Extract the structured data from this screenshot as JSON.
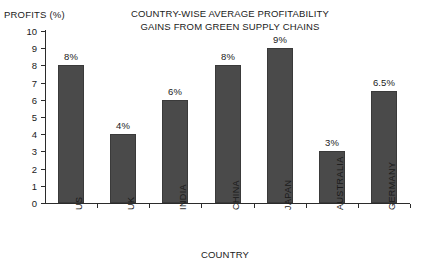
{
  "chart_data": {
    "type": "bar",
    "title": "COUNTRY-WISE AVERAGE PROFITABILITY GAINS FROM GREEN SUPPLY CHAINS",
    "title_lines": [
      "COUNTRY-WISE AVERAGE PROFITABILITY",
      "GAINS FROM GREEN SUPPLY CHAINS"
    ],
    "xlabel": "COUNTRY",
    "ylabel": "PROFITS (%)",
    "categories": [
      "US",
      "UK",
      "INDIA",
      "CHINA",
      "JAPAN",
      "AUSTRALIA",
      "GERMANY"
    ],
    "values": [
      8,
      4,
      6,
      8,
      9,
      3,
      6.5
    ],
    "data_labels": [
      "8%",
      "4%",
      "6%",
      "8%",
      "9%",
      "3%",
      "6.5%"
    ],
    "ylim": [
      0,
      10
    ],
    "ytick_labels": [
      "10",
      "9",
      "8",
      "7",
      "6",
      "5",
      "4",
      "3",
      "2",
      "1",
      "0"
    ],
    "ytick_values": [
      10,
      9,
      8,
      7,
      6,
      5,
      4,
      3,
      2,
      1,
      0
    ],
    "grid": false,
    "legend": false,
    "bar_color": "#4a4a4a",
    "axis_color": "#2b2b2b",
    "background_color": "#ffffff"
  }
}
